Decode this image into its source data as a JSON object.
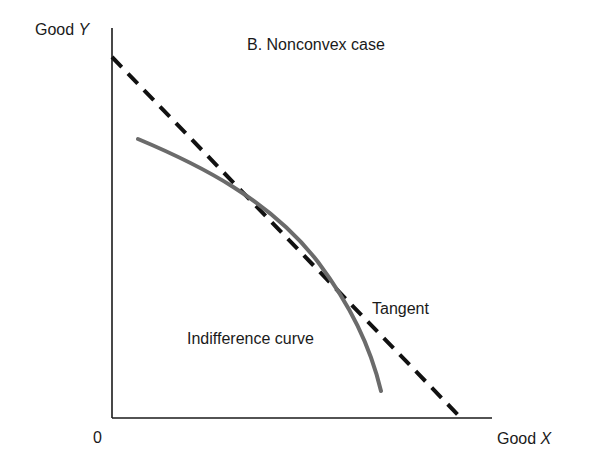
{
  "title": "B. Nonconvex case",
  "axes": {
    "y_label_prefix": "Good",
    "y_label_var": "Y",
    "x_label_prefix": "Good",
    "x_label_var": "X",
    "origin": "0"
  },
  "annotations": {
    "tangent": "Tangent",
    "indifference_curve": "Indifference curve"
  },
  "colors": {
    "axes": "#1a1a1a",
    "tangent_line": "#111111",
    "indifference_curve": "#6b6b6b"
  }
}
